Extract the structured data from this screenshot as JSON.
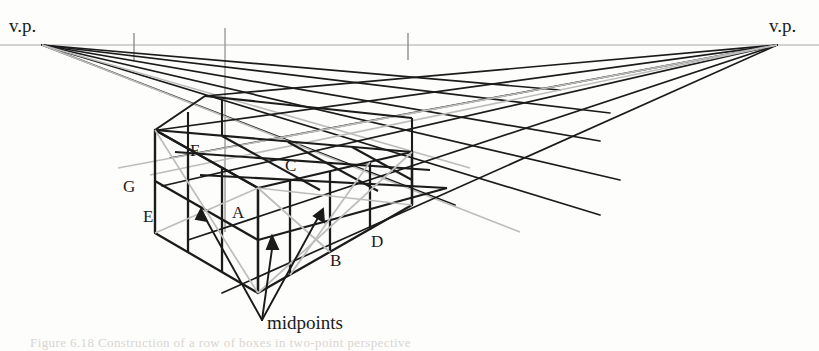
{
  "figure": {
    "type": "perspective-diagram",
    "width": 819,
    "height": 351,
    "background_color": "#fdfdfc"
  },
  "colors": {
    "ink": "#1b1b1b",
    "construction_line": "#9a9a9a",
    "horizon_line": "#a8a8a8",
    "diagonal_line": "#bdbdbd",
    "bleed_text": "#d9d6d2"
  },
  "vanishing_points": [
    {
      "id": "left-vp",
      "label": "v.p.",
      "x": 42,
      "y": 45,
      "label_x": 9,
      "label_y": 16
    },
    {
      "id": "right-vp",
      "label": "v.p.",
      "x": 777,
      "y": 45,
      "label_x": 769,
      "label_y": 16
    }
  ],
  "horizon": {
    "y": 45,
    "x_start": 0,
    "x_end": 819,
    "ticks": [
      {
        "x": 134,
        "y_top": 33,
        "y_bottom": 60
      },
      {
        "x": 408,
        "y_top": 33,
        "y_bottom": 60
      }
    ],
    "measuring_line": {
      "x": 225,
      "y_top": 28,
      "y_bottom": 232
    }
  },
  "point_labels": [
    {
      "id": "label-A",
      "text": "A",
      "x": 232,
      "y": 204
    },
    {
      "id": "label-B",
      "text": "B",
      "x": 330,
      "y": 252
    },
    {
      "id": "label-C",
      "text": "C",
      "x": 285,
      "y": 157
    },
    {
      "id": "label-D",
      "text": "D",
      "x": 371,
      "y": 233
    },
    {
      "id": "label-E",
      "text": "E",
      "x": 143,
      "y": 208
    },
    {
      "id": "label-F",
      "text": "F",
      "x": 190,
      "y": 142
    },
    {
      "id": "label-G",
      "text": "G",
      "x": 123,
      "y": 178
    }
  ],
  "annotation": {
    "id": "midpoints-annotation",
    "text": "midpoints",
    "label_x": 267,
    "label_y": 313,
    "arrow_origin": {
      "x": 262,
      "y": 320
    },
    "arrow_tips": [
      {
        "x": 201,
        "y": 212
      },
      {
        "x": 272,
        "y": 240
      },
      {
        "x": 322,
        "y": 212
      }
    ]
  },
  "bleed_through_text": [
    {
      "id": "bleed-line-1",
      "text": "Figure 6.18   Construction of a row of boxes in two-point perspective",
      "x": 30,
      "y": 335
    }
  ]
}
